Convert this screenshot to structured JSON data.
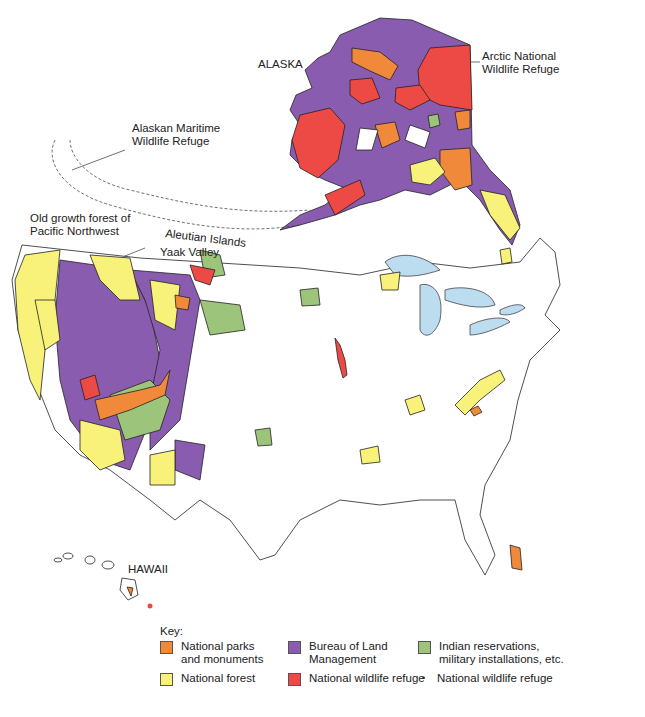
{
  "map": {
    "labels": {
      "alaska": "ALASKA",
      "anwr": [
        "Arctic National",
        "Wildlife Refuge"
      ],
      "maritime": [
        "Alaskan Maritime",
        "Wildlife Refuge"
      ],
      "aleutian": "Aleutian Islands",
      "oldgrowth": [
        "Old growth forest of",
        "Pacific Northwest"
      ],
      "yaak": "Yaak Valley",
      "hawaii": "HAWAII"
    },
    "colors": {
      "parks": "#f08a3a",
      "blm": "#8a5cb0",
      "reservations": "#9cc47a",
      "forest": "#f8f27a",
      "refuge": "#ee4a45",
      "water": "#bcdcf0",
      "outline": "#222222"
    }
  },
  "legend": {
    "title": "Key:",
    "items": [
      {
        "type": "swatch",
        "color": "#f08a3a",
        "label": [
          "National parks",
          "and monuments"
        ]
      },
      {
        "type": "swatch",
        "color": "#8a5cb0",
        "label": [
          "Bureau of Land",
          "Management"
        ]
      },
      {
        "type": "swatch",
        "color": "#9cc47a",
        "label": [
          "Indian reservations,",
          "military installations, etc."
        ]
      },
      {
        "type": "swatch",
        "color": "#f8f27a",
        "label": [
          "National forest"
        ]
      },
      {
        "type": "swatch",
        "color": "#ee4a45",
        "label": [
          "National wildlife refuge"
        ]
      },
      {
        "type": "dot",
        "symbol": "•",
        "label": [
          "National wildlife refuge"
        ]
      }
    ]
  }
}
